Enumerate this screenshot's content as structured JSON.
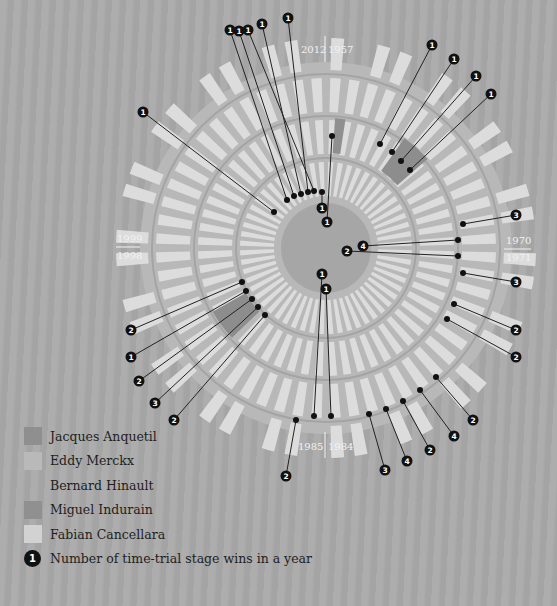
{
  "chart_data": {
    "type": "radial-bar",
    "title": "",
    "axis_labels": {
      "top": {
        "left": "2012",
        "right": "1957"
      },
      "right": {
        "top": "1970",
        "bottom": "1971"
      },
      "bottom": {
        "left": "1985",
        "right": "1984"
      },
      "left": {
        "top": "1999",
        "bottom": "1998"
      }
    },
    "legend": [
      {
        "name": "Jacques Anquetil",
        "color": "#8f8f8f"
      },
      {
        "name": "Eddy Merckx",
        "color": "#b9b9b9"
      },
      {
        "name": "Bernard Hinault",
        "color": "#a9a9a9"
      },
      {
        "name": "Miguel Indurain",
        "color": "#909090"
      },
      {
        "name": "Fabian Cancellara",
        "color": "#d2d2d2"
      }
    ],
    "legend_marker_label": "Number of time-trial stage wins in a year",
    "series": [
      {
        "rider": "Jacques Anquetil",
        "callouts": [
          1,
          1,
          1,
          1,
          1
        ]
      },
      {
        "rider": "Eddy Merckx",
        "callouts": [
          3,
          4,
          2,
          3,
          2,
          2
        ]
      },
      {
        "rider": "Bernard Hinault",
        "callouts": [
          2,
          4,
          2,
          4,
          3,
          1,
          1,
          2
        ]
      },
      {
        "rider": "Miguel Indurain",
        "callouts": [
          2,
          1,
          2,
          3,
          2
        ]
      },
      {
        "rider": "Fabian Cancellara",
        "callouts": [
          1,
          1,
          1,
          1,
          1,
          1,
          1
        ]
      }
    ]
  },
  "legend": {
    "items": [
      {
        "label": "Jacques Anquetil",
        "color": "#8f8f8f"
      },
      {
        "label": "Eddy Merckx",
        "color": "#b9b9b9"
      },
      {
        "label": "Bernard Hinault",
        "color": "#a9a9a9"
      },
      {
        "label": "Miguel Indurain",
        "color": "#909090"
      },
      {
        "label": "Fabian Cancellara",
        "color": "#d2d2d2"
      }
    ],
    "marker": {
      "value": "1",
      "label": "Number of time-trial stage wins in a year"
    }
  },
  "year_labels": {
    "top_left": "2012",
    "top_right": "1957",
    "right_top": "1970",
    "right_bottom": "1971",
    "bottom_left": "1985",
    "bottom_right": "1984",
    "left_top": "1999",
    "left_bottom": "1998"
  },
  "callouts": [
    {
      "dot": [
        287,
        200
      ],
      "label": [
        230,
        30
      ],
      "value": "1"
    },
    {
      "dot": [
        294,
        196
      ],
      "label": [
        239,
        31
      ],
      "value": "1"
    },
    {
      "dot": [
        301,
        194
      ],
      "label": [
        262,
        24
      ],
      "value": "1"
    },
    {
      "dot": [
        308,
        192
      ],
      "label": [
        288,
        18
      ],
      "value": "1"
    },
    {
      "dot": [
        314,
        191
      ],
      "label": [
        248,
        30
      ],
      "value": "1"
    },
    {
      "dot": [
        274,
        212
      ],
      "label": [
        143,
        112
      ],
      "value": "1"
    },
    {
      "dot": [
        322,
        192
      ],
      "label": [
        322,
        208
      ],
      "value": "1"
    },
    {
      "dot": [
        332,
        136
      ],
      "label": [
        327,
        222
      ],
      "value": "1"
    },
    {
      "dot": [
        380,
        144
      ],
      "label": [
        432,
        45
      ],
      "value": "1"
    },
    {
      "dot": [
        392,
        152
      ],
      "label": [
        454,
        59
      ],
      "value": "1"
    },
    {
      "dot": [
        401,
        161
      ],
      "label": [
        476,
        76
      ],
      "value": "1"
    },
    {
      "dot": [
        410,
        170
      ],
      "label": [
        491,
        94
      ],
      "value": "1"
    },
    {
      "dot": [
        463,
        224
      ],
      "label": [
        516,
        215
      ],
      "value": "3"
    },
    {
      "dot": [
        458,
        240
      ],
      "label": [
        363,
        246
      ],
      "value": "4"
    },
    {
      "dot": [
        458,
        256
      ],
      "label": [
        347,
        251
      ],
      "value": "2"
    },
    {
      "dot": [
        463,
        273
      ],
      "label": [
        516,
        282
      ],
      "value": "3"
    },
    {
      "dot": [
        454,
        304
      ],
      "label": [
        516,
        330
      ],
      "value": "2"
    },
    {
      "dot": [
        447,
        319
      ],
      "label": [
        516,
        357
      ],
      "value": "2"
    },
    {
      "dot": [
        242,
        282
      ],
      "label": [
        131,
        330
      ],
      "value": "2"
    },
    {
      "dot": [
        246,
        291
      ],
      "label": [
        131,
        357
      ],
      "value": "1"
    },
    {
      "dot": [
        252,
        299
      ],
      "label": [
        139,
        381
      ],
      "value": "2"
    },
    {
      "dot": [
        258,
        307
      ],
      "label": [
        155,
        403
      ],
      "value": "3"
    },
    {
      "dot": [
        265,
        315
      ],
      "label": [
        174,
        420
      ],
      "value": "2"
    },
    {
      "dot": [
        314,
        416
      ],
      "label": [
        322,
        274
      ],
      "value": "1"
    },
    {
      "dot": [
        331,
        416
      ],
      "label": [
        326,
        289
      ],
      "value": "1"
    },
    {
      "dot": [
        296,
        420
      ],
      "label": [
        286,
        476
      ],
      "value": "2"
    },
    {
      "dot": [
        369,
        414
      ],
      "label": [
        385,
        470
      ],
      "value": "3"
    },
    {
      "dot": [
        386,
        409
      ],
      "label": [
        407,
        461
      ],
      "value": "4"
    },
    {
      "dot": [
        403,
        401
      ],
      "label": [
        430,
        450
      ],
      "value": "2"
    },
    {
      "dot": [
        420,
        390
      ],
      "label": [
        454,
        436
      ],
      "value": "4"
    },
    {
      "dot": [
        436,
        377
      ],
      "label": [
        473,
        420
      ],
      "value": "2"
    }
  ]
}
